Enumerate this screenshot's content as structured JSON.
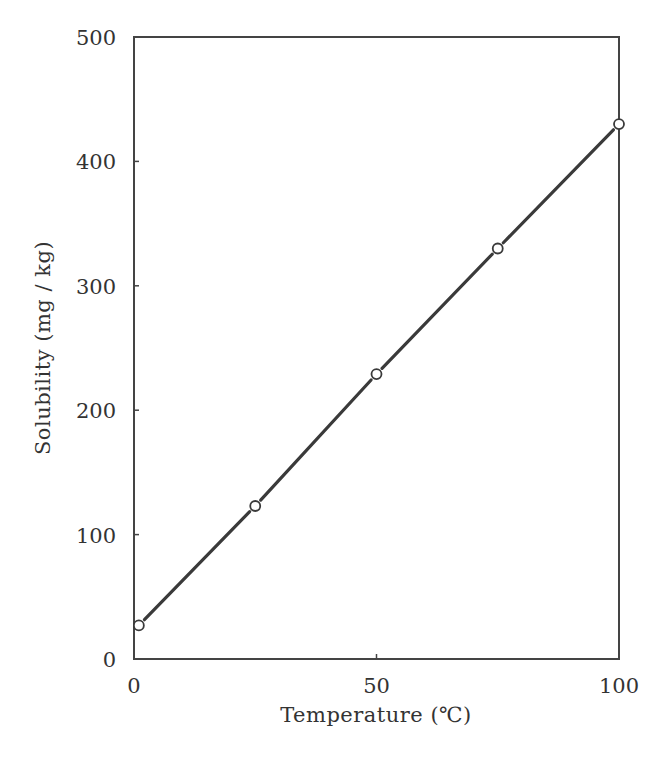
{
  "chart_data": {
    "type": "line",
    "title": "",
    "xlabel": "Temperature (℃)",
    "ylabel": "Solubility (mg / kg)",
    "xlim": [
      0,
      100
    ],
    "ylim": [
      0,
      500
    ],
    "xticks": [
      0,
      50,
      100
    ],
    "yticks": [
      0,
      100,
      200,
      300,
      400,
      500
    ],
    "grid": false,
    "legend": null,
    "series": [
      {
        "name": "Solubility",
        "marker": "open-circle",
        "x": [
          1,
          25,
          50,
          75,
          100
        ],
        "y": [
          27,
          123,
          229,
          330,
          430
        ]
      }
    ]
  },
  "labels": {
    "xlabel": "Temperature (℃)",
    "ylabel": "Solubility (mg / kg)",
    "xticks": [
      "0",
      "50",
      "100"
    ],
    "yticks": [
      "0",
      "100",
      "200",
      "300",
      "400",
      "500"
    ]
  },
  "colors": {
    "axis": "#444444",
    "line": "#3a3a3a",
    "text": "#333333"
  }
}
